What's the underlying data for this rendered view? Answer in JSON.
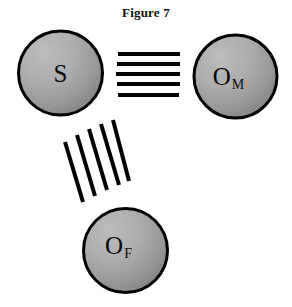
{
  "figure": {
    "title": "Figure 7",
    "width": 292,
    "height": 307,
    "background": "#ffffff"
  },
  "style": {
    "circle_fill_light": "#b2b2b2",
    "circle_fill_dark": "#868686",
    "circle_stroke": "#000000",
    "circle_stroke_width": 3,
    "line_color": "#000000",
    "label_color": "#0a0a0a"
  },
  "nodes": [
    {
      "id": "S",
      "label": "S",
      "subscript": "",
      "cx": 60.5,
      "cy": 73,
      "r": 42,
      "label_dx": 0,
      "label_dy": 0
    },
    {
      "id": "O_M",
      "label": "O",
      "subscript": "M",
      "cx": 235.5,
      "cy": 76.5,
      "r": 41.5,
      "label_dx": -7,
      "label_dy": 0
    },
    {
      "id": "O_F",
      "label": "O",
      "subscript": "F",
      "cx": 125.5,
      "cy": 250.5,
      "r": 42,
      "label_dx": -7,
      "label_dy": -5
    }
  ],
  "bonds": [
    {
      "id": "S-OM",
      "from": "S",
      "to": "O_M",
      "kind": "horizontal",
      "count": 5,
      "stroke_width": 4,
      "lines": [
        {
          "x1": 118,
          "y1": 54,
          "x2": 180,
          "y2": 54
        },
        {
          "x1": 117,
          "y1": 64,
          "x2": 180,
          "y2": 64
        },
        {
          "x1": 116,
          "y1": 74,
          "x2": 180,
          "y2": 74
        },
        {
          "x1": 117,
          "y1": 84,
          "x2": 180,
          "y2": 84
        },
        {
          "x1": 118,
          "y1": 95,
          "x2": 179,
          "y2": 95
        }
      ]
    },
    {
      "id": "S-OF",
      "from": "S",
      "to": "O_F",
      "kind": "diagonal",
      "count": 5,
      "stroke_width": 4,
      "lines": [
        {
          "x1": 65,
          "y1": 142,
          "x2": 83,
          "y2": 202
        },
        {
          "x1": 77,
          "y1": 135,
          "x2": 95,
          "y2": 196
        },
        {
          "x1": 89,
          "y1": 129,
          "x2": 107,
          "y2": 190
        },
        {
          "x1": 101,
          "y1": 124,
          "x2": 119,
          "y2": 185
        },
        {
          "x1": 113,
          "y1": 120,
          "x2": 129,
          "y2": 181
        }
      ]
    }
  ]
}
